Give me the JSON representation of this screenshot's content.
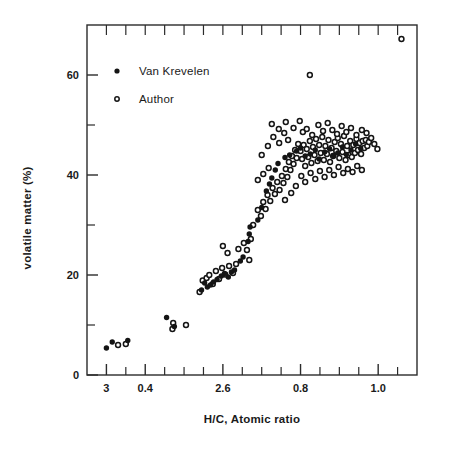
{
  "chart_data": {
    "type": "scatter",
    "title": "",
    "xlabel": "H/C, Atomic ratio",
    "ylabel": "volatile matter (%)",
    "xlim": [
      0.25,
      1.1
    ],
    "ylim": [
      0,
      70
    ],
    "grid": false,
    "legend_position": "top-left-inside",
    "xticklabels": [
      "3",
      "0.4",
      "2.6",
      "0.8",
      "1.0"
    ],
    "xtickvalues": [
      0.3,
      0.4,
      0.6,
      0.8,
      1.0
    ],
    "xminor_tickvalues": [
      0.35,
      0.45,
      0.5,
      0.55,
      0.65,
      0.7,
      0.75,
      0.85,
      0.9,
      0.95,
      1.05
    ],
    "yticklabels": [
      "0",
      "20",
      "40",
      "60"
    ],
    "ytickvalues": [
      0,
      20,
      40,
      60
    ],
    "yminor_tickvalues": [
      10,
      30,
      50
    ],
    "series": [
      {
        "name": "Van Krevelen",
        "marker": "filled-circle",
        "color": "#141414",
        "points": [
          [
            0.3,
            5.4
          ],
          [
            0.315,
            6.6
          ],
          [
            0.355,
            6.9
          ],
          [
            0.455,
            11.5
          ],
          [
            0.475,
            9.7
          ],
          [
            0.545,
            17.0
          ],
          [
            0.553,
            18.4
          ],
          [
            0.56,
            17.6
          ],
          [
            0.568,
            18.0
          ],
          [
            0.576,
            18.6
          ],
          [
            0.585,
            19.1
          ],
          [
            0.596,
            19.8
          ],
          [
            0.604,
            20.3
          ],
          [
            0.614,
            19.6
          ],
          [
            0.622,
            20.6
          ],
          [
            0.63,
            21.0
          ],
          [
            0.645,
            22.8
          ],
          [
            0.652,
            23.6
          ],
          [
            0.665,
            26.7
          ],
          [
            0.668,
            28.2
          ],
          [
            0.67,
            29.6
          ],
          [
            0.69,
            31.0
          ],
          [
            0.7,
            33.5
          ],
          [
            0.712,
            36.8
          ],
          [
            0.72,
            38.2
          ],
          [
            0.726,
            39.4
          ],
          [
            0.735,
            41.0
          ],
          [
            0.742,
            42.3
          ],
          [
            0.76,
            43.5
          ],
          [
            0.772,
            44.0
          ],
          [
            0.79,
            44.8
          ],
          [
            0.8,
            45.4
          ],
          [
            0.812,
            43.8
          ],
          [
            0.825,
            44.2
          ],
          [
            0.838,
            45.0
          ],
          [
            0.848,
            43.2
          ],
          [
            0.862,
            44.6
          ],
          [
            0.875,
            45.2
          ],
          [
            0.885,
            43.9
          ],
          [
            0.896,
            44.4
          ],
          [
            0.908,
            45.6
          ],
          [
            0.918,
            44.1
          ],
          [
            0.93,
            45.0
          ],
          [
            0.942,
            46.2
          ],
          [
            0.955,
            45.3
          ]
        ]
      },
      {
        "name": "Author",
        "marker": "open-circle",
        "color": "#141414",
        "points": [
          [
            0.33,
            6.0
          ],
          [
            0.35,
            6.2
          ],
          [
            0.47,
            9.2
          ],
          [
            0.472,
            10.4
          ],
          [
            0.505,
            10.0
          ],
          [
            0.54,
            16.6
          ],
          [
            0.548,
            18.9
          ],
          [
            0.558,
            19.4
          ],
          [
            0.565,
            20.0
          ],
          [
            0.574,
            18.2
          ],
          [
            0.582,
            20.8
          ],
          [
            0.59,
            19.2
          ],
          [
            0.598,
            21.4
          ],
          [
            0.606,
            20.1
          ],
          [
            0.616,
            21.8
          ],
          [
            0.626,
            20.4
          ],
          [
            0.634,
            22.2
          ],
          [
            0.6,
            25.8
          ],
          [
            0.612,
            24.4
          ],
          [
            0.64,
            25.2
          ],
          [
            0.654,
            26.4
          ],
          [
            0.662,
            25.0
          ],
          [
            0.672,
            27.2
          ],
          [
            0.668,
            23.0
          ],
          [
            0.678,
            30.0
          ],
          [
            0.69,
            33.0
          ],
          [
            0.698,
            31.8
          ],
          [
            0.704,
            34.6
          ],
          [
            0.71,
            33.2
          ],
          [
            0.715,
            36.0
          ],
          [
            0.722,
            34.8
          ],
          [
            0.728,
            37.4
          ],
          [
            0.734,
            36.2
          ],
          [
            0.74,
            38.6
          ],
          [
            0.746,
            37.0
          ],
          [
            0.752,
            39.8
          ],
          [
            0.756,
            38.4
          ],
          [
            0.762,
            41.2
          ],
          [
            0.766,
            39.6
          ],
          [
            0.77,
            42.6
          ],
          [
            0.774,
            41.0
          ],
          [
            0.778,
            43.8
          ],
          [
            0.782,
            42.2
          ],
          [
            0.786,
            45.0
          ],
          [
            0.79,
            43.4
          ],
          [
            0.794,
            46.2
          ],
          [
            0.7,
            44.0
          ],
          [
            0.716,
            45.8
          ],
          [
            0.73,
            47.6
          ],
          [
            0.745,
            46.4
          ],
          [
            0.758,
            48.4
          ],
          [
            0.768,
            47.0
          ],
          [
            0.726,
            50.2
          ],
          [
            0.744,
            49.2
          ],
          [
            0.762,
            50.6
          ],
          [
            0.782,
            49.4
          ],
          [
            0.798,
            50.8
          ],
          [
            0.806,
            48.6
          ],
          [
            0.8,
            44.8
          ],
          [
            0.804,
            43.2
          ],
          [
            0.808,
            46.0
          ],
          [
            0.812,
            41.8
          ],
          [
            0.816,
            45.2
          ],
          [
            0.82,
            43.6
          ],
          [
            0.824,
            46.8
          ],
          [
            0.828,
            42.4
          ],
          [
            0.832,
            45.6
          ],
          [
            0.836,
            44.0
          ],
          [
            0.84,
            47.2
          ],
          [
            0.844,
            42.8
          ],
          [
            0.848,
            46.0
          ],
          [
            0.852,
            44.4
          ],
          [
            0.856,
            47.6
          ],
          [
            0.86,
            43.0
          ],
          [
            0.864,
            45.8
          ],
          [
            0.868,
            44.2
          ],
          [
            0.872,
            47.0
          ],
          [
            0.876,
            42.6
          ],
          [
            0.88,
            45.4
          ],
          [
            0.884,
            43.8
          ],
          [
            0.888,
            46.6
          ],
          [
            0.892,
            44.8
          ],
          [
            0.896,
            47.4
          ],
          [
            0.9,
            43.4
          ],
          [
            0.904,
            46.2
          ],
          [
            0.908,
            44.6
          ],
          [
            0.912,
            47.8
          ],
          [
            0.916,
            43.0
          ],
          [
            0.92,
            45.8
          ],
          [
            0.924,
            44.0
          ],
          [
            0.928,
            46.8
          ],
          [
            0.932,
            43.6
          ],
          [
            0.936,
            46.0
          ],
          [
            0.94,
            44.4
          ],
          [
            0.944,
            47.2
          ],
          [
            0.948,
            45.0
          ],
          [
            0.952,
            46.4
          ],
          [
            0.956,
            44.2
          ],
          [
            0.96,
            46.8
          ],
          [
            0.964,
            45.4
          ],
          [
            0.968,
            47.0
          ],
          [
            0.972,
            45.8
          ],
          [
            0.976,
            46.6
          ],
          [
            0.816,
            49.2
          ],
          [
            0.83,
            48.0
          ],
          [
            0.846,
            50.0
          ],
          [
            0.858,
            48.8
          ],
          [
            0.87,
            50.4
          ],
          [
            0.882,
            49.0
          ],
          [
            0.894,
            48.2
          ],
          [
            0.906,
            49.8
          ],
          [
            0.918,
            48.6
          ],
          [
            0.93,
            49.4
          ],
          [
            0.944,
            48.0
          ],
          [
            0.958,
            49.0
          ],
          [
            0.97,
            48.4
          ],
          [
            0.982,
            47.4
          ],
          [
            0.99,
            46.2
          ],
          [
            0.998,
            45.2
          ],
          [
            0.802,
            39.8
          ],
          [
            0.812,
            38.6
          ],
          [
            0.826,
            40.4
          ],
          [
            0.838,
            39.2
          ],
          [
            0.85,
            40.8
          ],
          [
            0.862,
            39.6
          ],
          [
            0.874,
            41.0
          ],
          [
            0.886,
            40.0
          ],
          [
            0.898,
            41.6
          ],
          [
            0.91,
            40.4
          ],
          [
            0.922,
            41.2
          ],
          [
            0.934,
            40.6
          ],
          [
            0.946,
            41.8
          ],
          [
            0.958,
            41.0
          ],
          [
            0.76,
            35.0
          ],
          [
            0.776,
            36.4
          ],
          [
            0.788,
            37.8
          ],
          [
            0.69,
            39.0
          ],
          [
            0.704,
            40.2
          ],
          [
            0.718,
            41.4
          ],
          [
            0.824,
            60.0
          ],
          [
            1.06,
            67.2
          ]
        ]
      }
    ],
    "notes": {
      "point_count_van_krevelen": 45,
      "point_count_author": 139
    }
  },
  "legend": {
    "items": [
      {
        "label": "Van Krevelen",
        "marker": "filled-circle"
      },
      {
        "label": "Author",
        "marker": "open-circle"
      }
    ]
  }
}
